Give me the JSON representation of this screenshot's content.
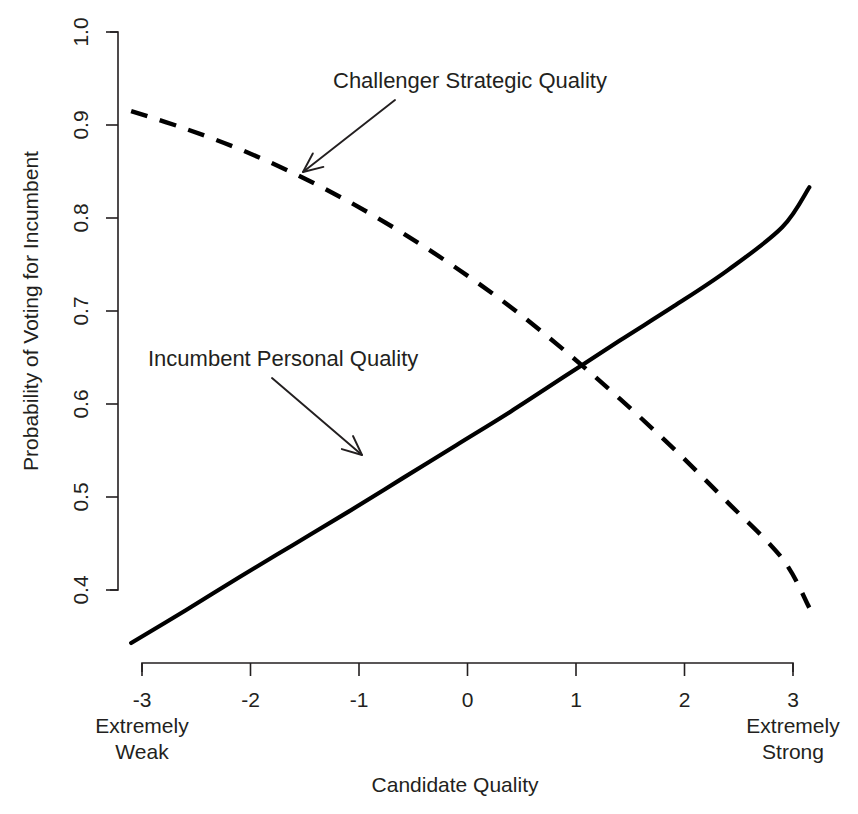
{
  "chart_data": {
    "type": "line",
    "title": "",
    "xlabel": "Candidate Quality",
    "ylabel": "Probability of Voting for Incumbent",
    "xlim": [
      -3,
      3
    ],
    "ylim": [
      0.4,
      1.0
    ],
    "grid": false,
    "legend_position": "inline-annotations",
    "x_ticks": [
      "-3",
      "-2",
      "-1",
      "0",
      "1",
      "2",
      "3"
    ],
    "x_tick_values": [
      -3,
      -2,
      -1,
      0,
      1,
      2,
      3
    ],
    "y_ticks": [
      "0.4",
      "0.5",
      "0.6",
      "0.7",
      "0.8",
      "0.9",
      "1.0"
    ],
    "y_tick_values": [
      0.4,
      0.5,
      0.6,
      0.7,
      0.8,
      0.9,
      1.0
    ],
    "x_axis_endcap_left": "Extremely\nWeak",
    "x_axis_endcap_left_line1": "Extremely",
    "x_axis_endcap_left_line2": "Weak",
    "x_axis_endcap_right_line1": "Extremely",
    "x_axis_endcap_right_line2": "Strong",
    "series": [
      {
        "name": "Incumbent Personal Quality",
        "style": "solid",
        "color": "#000000",
        "x": [
          -3.1,
          -2.6,
          -2.1,
          -1.6,
          -1.1,
          -0.6,
          -0.1,
          0.4,
          0.9,
          1.4,
          1.9,
          2.4,
          2.9,
          3.15
        ],
        "values": [
          0.343,
          0.378,
          0.414,
          0.449,
          0.484,
          0.52,
          0.556,
          0.592,
          0.63,
          0.668,
          0.705,
          0.744,
          0.79,
          0.833
        ]
      },
      {
        "name": "Challenger Strategic Quality",
        "style": "dashed",
        "color": "#000000",
        "x": [
          -3.1,
          -2.6,
          -2.1,
          -1.6,
          -1.1,
          -0.6,
          -0.1,
          0.4,
          0.9,
          1.4,
          1.9,
          2.4,
          2.9,
          3.15
        ],
        "values": [
          0.915,
          0.896,
          0.874,
          0.848,
          0.818,
          0.784,
          0.746,
          0.704,
          0.657,
          0.606,
          0.552,
          0.494,
          0.434,
          0.381
        ]
      }
    ],
    "annotations": [
      {
        "label": "Challenger Strategic Quality",
        "target_series": "Challenger Strategic Quality",
        "text_x": 333,
        "text_y": 88,
        "arrow_from_x": 395,
        "arrow_from_y": 100,
        "arrow_to_x": 303,
        "arrow_to_y": 172
      },
      {
        "label": "Incumbent Personal Quality",
        "target_series": "Incumbent Personal Quality",
        "text_x": 148,
        "text_y": 366,
        "arrow_from_x": 272,
        "arrow_from_y": 378,
        "arrow_to_x": 362,
        "arrow_to_y": 455
      }
    ],
    "crossing_point": {
      "x": 0.6,
      "y": 0.66
    }
  },
  "colors": {
    "ink": "#231f20",
    "series": "#000000",
    "background": "#ffffff"
  }
}
